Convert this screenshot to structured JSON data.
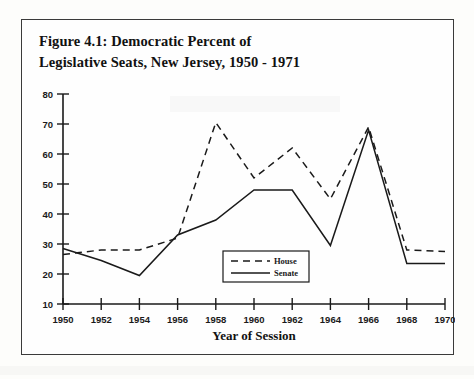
{
  "figure": {
    "title_line1": "Figure 4.1: Democratic Percent of",
    "title_line2": "Legislative Seats, New Jersey, 1950 - 1971"
  },
  "chart_data": {
    "type": "line",
    "title": "Figure 4.1: Democratic Percent of Legislative Seats, New Jersey, 1950 - 1971",
    "xlabel": "Year of Session",
    "ylabel": "",
    "x": [
      1950,
      1952,
      1954,
      1956,
      1958,
      1960,
      1962,
      1964,
      1966,
      1968,
      1970
    ],
    "categories": [
      "1950",
      "1952",
      "1954",
      "1956",
      "1958",
      "1960",
      "1962",
      "1964",
      "1966",
      "1968",
      "1970"
    ],
    "series": [
      {
        "name": "House",
        "style": "dashed",
        "values": [
          26.5,
          28,
          28,
          32,
          70.5,
          52,
          62,
          45,
          69,
          28,
          27.5
        ]
      },
      {
        "name": "Senate",
        "style": "solid",
        "values": [
          28.5,
          24.5,
          19.5,
          33,
          38,
          48,
          48,
          29.5,
          68,
          23.5,
          23.5
        ]
      }
    ],
    "xlim": [
      1950,
      1970
    ],
    "ylim": [
      10,
      80
    ],
    "ytick_values": [
      10,
      20,
      30,
      40,
      50,
      60,
      70,
      80
    ],
    "ytick_labels": [
      "10",
      "20",
      "30",
      "40",
      "50",
      "60",
      "70",
      "80"
    ],
    "xtick_labels": [
      "1950",
      "1952",
      "1954",
      "1956",
      "1958",
      "1960",
      "1962",
      "1964",
      "1966",
      "1968",
      "1970"
    ],
    "grid": false,
    "legend_position": "center",
    "legend_entries": [
      "House",
      "Senate"
    ],
    "line_color": "#1a1a1a"
  }
}
